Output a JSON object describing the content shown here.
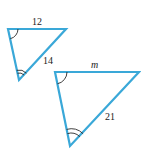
{
  "diagram": {
    "title": "",
    "colors": {
      "triangle_stroke": "#3aa8d8",
      "angle_mark": "#2a2a2a",
      "label": "#222222",
      "background": "#ffffff"
    },
    "small_triangle": {
      "vertices": [
        [
          8,
          29
        ],
        [
          66,
          29
        ],
        [
          19,
          80
        ]
      ],
      "labels": {
        "top_side": "12",
        "right_side": "14"
      },
      "angle_marks": {
        "top_left": "single-arc",
        "bottom": "double-arc"
      }
    },
    "large_triangle": {
      "vertices": [
        [
          55,
          72
        ],
        [
          139,
          72
        ],
        [
          70,
          146
        ]
      ],
      "labels": {
        "top_side": "m",
        "right_side": "21"
      },
      "angle_marks": {
        "top_left": "single-arc",
        "bottom": "double-arc"
      }
    }
  }
}
